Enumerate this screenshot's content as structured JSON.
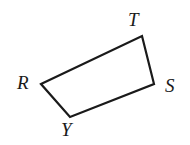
{
  "figure": {
    "kind": "geometry-diagram",
    "shape_name": "quadrilateral",
    "background_color": "#ffffff",
    "stroke_color": "#1a1a1a",
    "stroke_width": 2.2,
    "canvas": {
      "width": 190,
      "height": 145
    },
    "vertices": [
      {
        "id": "R",
        "label": "R",
        "x": 41,
        "y": 84,
        "label_x": 17,
        "label_y": 73
      },
      {
        "id": "T",
        "label": "T",
        "x": 142,
        "y": 36,
        "label_x": 128,
        "label_y": 10
      },
      {
        "id": "S",
        "label": "S",
        "x": 154,
        "y": 84,
        "label_x": 165,
        "label_y": 76
      },
      {
        "id": "Y",
        "label": "Y",
        "x": 70,
        "y": 117,
        "label_x": 61,
        "label_y": 120
      }
    ],
    "edges": [
      {
        "id": "RT",
        "from": "R",
        "to": "T"
      },
      {
        "id": "TS",
        "from": "T",
        "to": "S"
      },
      {
        "id": "SY",
        "from": "S",
        "to": "Y"
      },
      {
        "id": "YR",
        "from": "Y",
        "to": "R"
      }
    ],
    "path_d": "M 41 84 L 142 36 L 154 84 L 70 117 Z"
  }
}
